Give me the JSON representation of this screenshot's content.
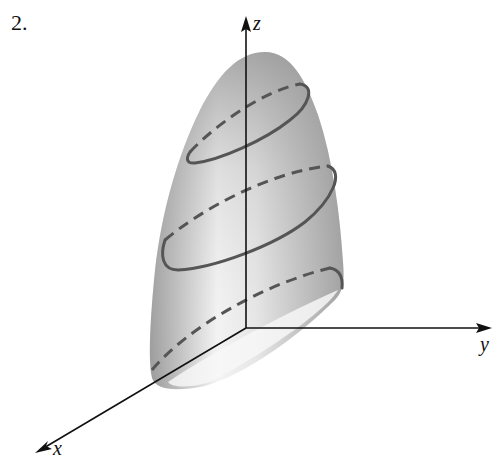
{
  "figure": {
    "number_label": "2.",
    "axes": {
      "x_label": "x",
      "y_label": "y",
      "z_label": "z"
    },
    "colors": {
      "axis": "#111111",
      "curve": "#555555",
      "surface_dark": "#8a8a8a",
      "surface_light": "#f2f2f2",
      "background": "#ffffff"
    }
  }
}
